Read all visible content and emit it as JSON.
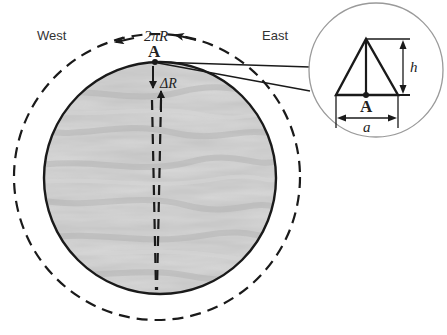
{
  "diagram": {
    "labels": {
      "west": "West",
      "east": "East",
      "circumference": "2πR",
      "point_a_main": "A",
      "delta_r": "ΔR",
      "point_a_inset": "A",
      "height": "h",
      "base": "a"
    },
    "colors": {
      "planet_fill": "#c8c8c8",
      "planet_stroke": "#1a1a1a",
      "dashed_orbit": "#1a1a1a",
      "inset_circle_stroke": "#9a9a9a",
      "background": "#ffffff"
    },
    "elements": {
      "planet": "Textured gray sphere (wood-grain style) representing a planet of radius R",
      "orbit": "Dashed outer circle showing path of length 2πR with arrows pointing west",
      "vertical_path": "Dashed vertical double line through point A with arrows indicating ΔR",
      "inset": "Magnified view of a pyramid/triangle at point A with height h and base a"
    }
  }
}
